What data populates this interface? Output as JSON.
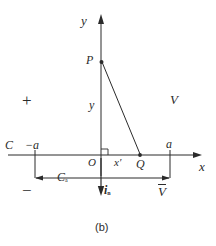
{
  "figure": {
    "caption": "(b)",
    "axes": {
      "x_label": "x",
      "y_label": "y",
      "origin_label": "O"
    },
    "points": [
      {
        "name": "P",
        "label": "P",
        "x": 101,
        "y": 62
      },
      {
        "name": "Q",
        "label": "Q",
        "x": 140,
        "y": 155
      }
    ],
    "labels": {
      "plus_sign": "+",
      "minus_sign": "−",
      "contour": "C",
      "left_bound": "−a",
      "right_bound": "a",
      "segment_y": "y",
      "segment_x_prime": "x′",
      "potential": "V",
      "potential_bar": "V",
      "normal_vector": "i",
      "normal_vector_sub": "n",
      "dim_label": "C",
      "dim_label_sub": "a"
    },
    "colors": {
      "line": "#2b2b2b",
      "background": "#ffffff"
    }
  }
}
